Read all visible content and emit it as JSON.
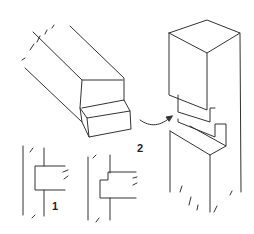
{
  "diagram": {
    "labels": {
      "figure_1": "1",
      "figure_2": "2"
    },
    "colors": {
      "line": "#333333",
      "background": "#ffffff"
    }
  }
}
